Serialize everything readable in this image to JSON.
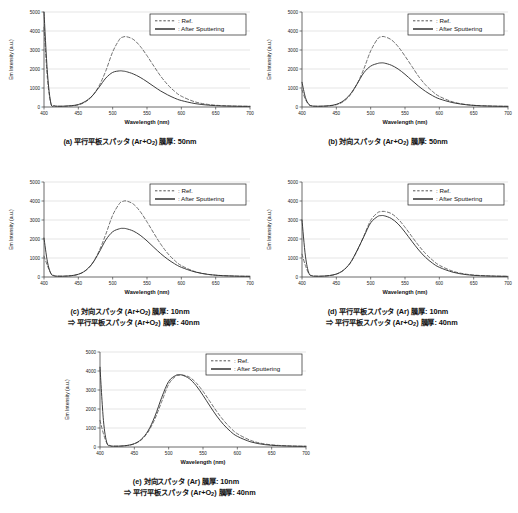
{
  "figure": {
    "panel_count": 5,
    "axis": {
      "xlabel": "Wavelength (nm)",
      "ylabel": "Em Intensity (a.u.)",
      "xticks": [
        400,
        450,
        500,
        550,
        600,
        650,
        700
      ],
      "yticks": [
        0,
        1000,
        2000,
        3000,
        4000,
        5000
      ],
      "xlim": [
        400,
        700
      ],
      "ylim": [
        0,
        5000
      ],
      "grid": "horizontal"
    },
    "legend": {
      "position": "top-right",
      "entries": [
        {
          "style": "dotted",
          "label": ": Ref."
        },
        {
          "style": "solid",
          "label": ": After Sputtering"
        }
      ]
    },
    "colors": {
      "ref_line": "#555555",
      "after_line": "#333333",
      "grid": "#c8c8c8",
      "axis": "#444444",
      "background": "#ffffff"
    }
  },
  "panels": [
    {
      "id": "a",
      "caption_line1": "(a) 平行平板スパッタ (Ar+O2) 膜厚: 50nm",
      "caption_line2": "",
      "caption_label": "(a)",
      "method": "平行平板スパッタ",
      "gas": "Ar+O2",
      "thickness": "50nm"
    },
    {
      "id": "b",
      "caption_line1": "(b) 対向スパッタ (Ar+O2) 膜厚: 50nm",
      "caption_line2": "",
      "caption_label": "(b)",
      "method": "対向スパッタ",
      "gas": "Ar+O2",
      "thickness": "50nm"
    },
    {
      "id": "c",
      "caption_line1": "(c) 対向スパッタ (Ar+O2) 膜厚: 10nm",
      "caption_line2": "⇒ 平行平板スパッタ (Ar+O2) 膜厚: 40nm",
      "caption_label": "(c)",
      "method": "対向スパッタ",
      "gas": "Ar+O2",
      "thickness": "10nm"
    },
    {
      "id": "d",
      "caption_line1": "(d) 平行平板スパッタ (Ar) 膜厚: 10nm",
      "caption_line2": "⇒ 平行平板スパッタ (Ar+O2) 膜厚: 40nm",
      "caption_label": "(d)",
      "method": "平行平板スパッタ",
      "gas": "Ar",
      "thickness": "10nm"
    },
    {
      "id": "e",
      "caption_line1": "(e) 対向スパッタ (Ar) 膜厚: 10nm",
      "caption_line2": "⇒ 平行平板スパッタ (Ar+O2) 膜厚: 40nm",
      "caption_label": "(e)",
      "method": "対向スパッタ",
      "gas": "Ar",
      "thickness": "10nm"
    }
  ],
  "chart_data": [
    {
      "type": "line",
      "panel": "a",
      "title": "(a) 平行平板スパッタ (Ar+O2) 膜厚: 50nm",
      "xlabel": "Wavelength (nm)",
      "ylabel": "Em Intensity (a.u.)",
      "xlim": [
        400,
        700
      ],
      "ylim": [
        0,
        5000
      ],
      "x": [
        400,
        405,
        410,
        415,
        420,
        430,
        440,
        450,
        460,
        470,
        480,
        490,
        500,
        510,
        515,
        520,
        530,
        540,
        550,
        560,
        570,
        580,
        590,
        600,
        620,
        640,
        660,
        680,
        700
      ],
      "series": [
        {
          "name": ": Ref.",
          "style": "dotted",
          "values": [
            4200,
            1500,
            180,
            60,
            40,
            40,
            60,
            110,
            260,
            560,
            1100,
            1900,
            2900,
            3560,
            3680,
            3700,
            3560,
            3200,
            2700,
            2150,
            1620,
            1180,
            830,
            570,
            270,
            130,
            70,
            45,
            35
          ],
          "peak_x": 520,
          "peak_y": 3700
        },
        {
          "name": ": After Sputtering",
          "style": "solid",
          "values": [
            5000,
            1800,
            200,
            60,
            40,
            45,
            70,
            130,
            290,
            580,
            1030,
            1520,
            1820,
            1900,
            1890,
            1860,
            1740,
            1560,
            1330,
            1080,
            840,
            640,
            470,
            340,
            180,
            95,
            55,
            40,
            32
          ],
          "peak_x": 512,
          "peak_y": 1900
        }
      ]
    },
    {
      "type": "line",
      "panel": "b",
      "title": "(b) 対向スパッタ (Ar+O2) 膜厚: 50nm",
      "xlabel": "Wavelength (nm)",
      "ylabel": "Em Intensity (a.u.)",
      "xlim": [
        400,
        700
      ],
      "ylim": [
        0,
        5000
      ],
      "x": [
        400,
        405,
        410,
        415,
        420,
        430,
        440,
        450,
        460,
        470,
        480,
        490,
        500,
        510,
        515,
        520,
        530,
        540,
        550,
        560,
        570,
        580,
        590,
        600,
        620,
        640,
        660,
        680,
        700
      ],
      "series": [
        {
          "name": ": Ref.",
          "style": "dotted",
          "values": [
            900,
            400,
            120,
            55,
            40,
            40,
            60,
            120,
            280,
            620,
            1200,
            2000,
            2950,
            3580,
            3690,
            3700,
            3540,
            3180,
            2680,
            2140,
            1600,
            1160,
            820,
            560,
            265,
            125,
            70,
            45,
            35
          ],
          "peak_x": 519,
          "peak_y": 3700
        },
        {
          "name": ": After Sputtering",
          "style": "solid",
          "values": [
            1300,
            500,
            140,
            55,
            40,
            45,
            70,
            140,
            320,
            660,
            1200,
            1800,
            2150,
            2290,
            2320,
            2310,
            2200,
            2000,
            1720,
            1400,
            1090,
            820,
            600,
            430,
            225,
            115,
            62,
            42,
            33
          ],
          "peak_x": 516,
          "peak_y": 2320
        }
      ]
    },
    {
      "type": "line",
      "panel": "c",
      "title": "(c) 対向スパッタ (Ar+O2) 膜厚: 10nm ⇒ 平行平板スパッタ (Ar+O2) 膜厚: 40nm",
      "xlabel": "Wavelength (nm)",
      "ylabel": "Em Intensity (a.u.)",
      "xlim": [
        400,
        700
      ],
      "ylim": [
        0,
        5000
      ],
      "x": [
        400,
        405,
        410,
        415,
        420,
        430,
        440,
        450,
        460,
        470,
        480,
        490,
        500,
        510,
        515,
        520,
        530,
        540,
        550,
        560,
        570,
        580,
        590,
        600,
        620,
        640,
        660,
        680,
        700
      ],
      "series": [
        {
          "name": ": Ref.",
          "style": "dotted",
          "values": [
            1100,
            600,
            200,
            70,
            45,
            45,
            70,
            140,
            320,
            700,
            1350,
            2250,
            3250,
            3870,
            3980,
            4000,
            3840,
            3450,
            2900,
            2300,
            1730,
            1250,
            880,
            600,
            285,
            135,
            72,
            46,
            35
          ],
          "peak_x": 520,
          "peak_y": 4000
        },
        {
          "name": ": After Sputtering",
          "style": "solid",
          "values": [
            2050,
            800,
            180,
            60,
            42,
            45,
            72,
            145,
            330,
            690,
            1280,
            1950,
            2380,
            2540,
            2560,
            2540,
            2420,
            2200,
            1900,
            1560,
            1230,
            940,
            700,
            510,
            265,
            130,
            70,
            45,
            34
          ],
          "peak_x": 517,
          "peak_y": 2560
        }
      ]
    },
    {
      "type": "line",
      "panel": "d",
      "title": "(d) 平行平板スパッタ (Ar) 膜厚: 10nm ⇒ 平行平板スパッタ (Ar+O2) 膜厚: 40nm",
      "xlabel": "Wavelength (nm)",
      "ylabel": "Em Intensity (a.u.)",
      "xlim": [
        400,
        700
      ],
      "ylim": [
        0,
        5000
      ],
      "x": [
        400,
        405,
        410,
        415,
        420,
        430,
        440,
        450,
        460,
        470,
        480,
        490,
        500,
        510,
        515,
        520,
        530,
        540,
        550,
        560,
        570,
        580,
        590,
        600,
        620,
        640,
        660,
        680,
        700
      ],
      "series": [
        {
          "name": ": Ref.",
          "style": "dotted",
          "values": [
            1200,
            600,
            180,
            65,
            45,
            45,
            75,
            150,
            340,
            720,
            1350,
            2150,
            2980,
            3380,
            3440,
            3450,
            3340,
            3050,
            2620,
            2130,
            1650,
            1230,
            890,
            620,
            300,
            145,
            78,
            48,
            36
          ],
          "peak_x": 521,
          "peak_y": 3450
        },
        {
          "name": ": After Sputtering",
          "style": "solid",
          "values": [
            3000,
            1100,
            200,
            60,
            42,
            46,
            78,
            155,
            350,
            730,
            1380,
            2120,
            2850,
            3180,
            3230,
            3220,
            3080,
            2790,
            2360,
            1880,
            1420,
            1030,
            730,
            510,
            250,
            120,
            65,
            43,
            33
          ],
          "peak_x": 514,
          "peak_y": 3230
        }
      ]
    },
    {
      "type": "line",
      "panel": "e",
      "title": "(e) 対向スパッタ (Ar) 膜厚: 10nm ⇒ 平行平板スパッタ (Ar+O2) 膜厚: 40nm",
      "xlabel": "Wavelength (nm)",
      "ylabel": "Em Intensity (a.u.)",
      "xlim": [
        400,
        700
      ],
      "ylim": [
        0,
        5000
      ],
      "x": [
        400,
        405,
        410,
        415,
        420,
        430,
        440,
        450,
        460,
        470,
        480,
        490,
        500,
        510,
        515,
        520,
        530,
        540,
        550,
        560,
        570,
        580,
        590,
        600,
        620,
        640,
        660,
        680,
        700
      ],
      "series": [
        {
          "name": ": Ref.",
          "style": "dotted",
          "values": [
            1400,
            700,
            200,
            70,
            45,
            48,
            80,
            165,
            370,
            790,
            1480,
            2400,
            3300,
            3720,
            3780,
            3790,
            3680,
            3380,
            2930,
            2400,
            1870,
            1400,
            1010,
            700,
            340,
            160,
            85,
            52,
            38
          ],
          "peak_x": 523,
          "peak_y": 3790
        },
        {
          "name": ": After Sputtering",
          "style": "solid",
          "values": [
            4200,
            1400,
            220,
            62,
            42,
            50,
            85,
            175,
            400,
            850,
            1620,
            2620,
            3450,
            3760,
            3800,
            3780,
            3600,
            3230,
            2720,
            2160,
            1630,
            1180,
            820,
            560,
            265,
            125,
            68,
            44,
            34
          ],
          "peak_x": 514,
          "peak_y": 3800
        }
      ]
    }
  ]
}
